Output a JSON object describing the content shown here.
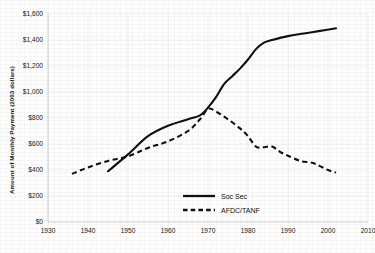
{
  "chart_data": {
    "type": "line",
    "title": "",
    "xlabel": "",
    "ylabel": "Amount of Monthly Payment (2003 dollars)",
    "xlim": [
      1930,
      2010
    ],
    "ylim": [
      0,
      1600
    ],
    "grid": true,
    "legend_position": "inside-bottom-center",
    "x_ticks": [
      "1930",
      "1940",
      "1950",
      "1960",
      "1970",
      "1980",
      "1990",
      "2000",
      "2010"
    ],
    "y_ticks": [
      "$0",
      "$200",
      "$400",
      "$600",
      "$800",
      "$1,000",
      "$1,200",
      "$1,400",
      "$1,600"
    ],
    "series": [
      {
        "name": "Soc Sec",
        "style": "solid",
        "color": "#111111",
        "points": [
          [
            1945,
            390
          ],
          [
            1950,
            520
          ],
          [
            1955,
            660
          ],
          [
            1960,
            740
          ],
          [
            1965,
            790
          ],
          [
            1968,
            820
          ],
          [
            1970,
            880
          ],
          [
            1972,
            960
          ],
          [
            1974,
            1060
          ],
          [
            1976,
            1120
          ],
          [
            1978,
            1180
          ],
          [
            1980,
            1250
          ],
          [
            1982,
            1330
          ],
          [
            1984,
            1380
          ],
          [
            1986,
            1400
          ],
          [
            1990,
            1430
          ],
          [
            1994,
            1450
          ],
          [
            1998,
            1470
          ],
          [
            2002,
            1490
          ]
        ]
      },
      {
        "name": "AFDC/TANF",
        "style": "dashed",
        "color": "#111111",
        "points": [
          [
            1936,
            370
          ],
          [
            1940,
            420
          ],
          [
            1945,
            470
          ],
          [
            1950,
            505
          ],
          [
            1955,
            570
          ],
          [
            1960,
            620
          ],
          [
            1965,
            700
          ],
          [
            1968,
            790
          ],
          [
            1970,
            870
          ],
          [
            1972,
            850
          ],
          [
            1975,
            790
          ],
          [
            1978,
            720
          ],
          [
            1980,
            660
          ],
          [
            1982,
            580
          ],
          [
            1984,
            575
          ],
          [
            1986,
            580
          ],
          [
            1988,
            540
          ],
          [
            1990,
            510
          ],
          [
            1993,
            470
          ],
          [
            1996,
            455
          ],
          [
            1998,
            430
          ],
          [
            2000,
            400
          ],
          [
            2002,
            380
          ]
        ]
      }
    ],
    "legend": [
      {
        "label": "Soc Sec",
        "style": "solid"
      },
      {
        "label": "AFDC/TANF",
        "style": "dashed"
      }
    ]
  }
}
